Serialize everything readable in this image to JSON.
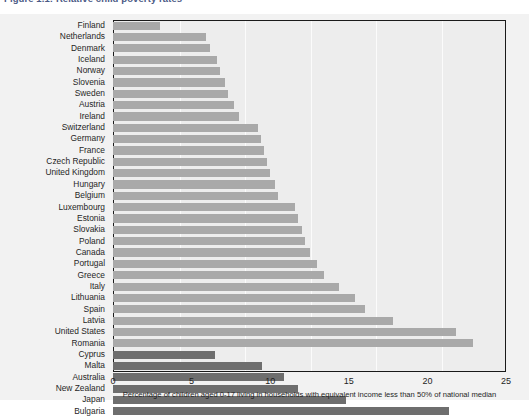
{
  "figure": {
    "title": "Figure 1.1: Relative child poverty rates"
  },
  "axis": {
    "x_label": "Percentage of children aged 0-17 living in households with equivalent income less than 50% of national median",
    "x_ticks": [
      "0",
      "5",
      "10",
      "15",
      "20",
      "25"
    ]
  },
  "colors": {
    "bar_light": "#a9a9a9",
    "bar_dark": "#6e6e6e",
    "plot_background": "#ededed",
    "figure_background": "#f2f2f2",
    "frame": "#1a1a1a",
    "title": "#23356b"
  },
  "chart_data": {
    "type": "bar",
    "orientation": "horizontal",
    "title": "Figure 1.1: Relative child poverty rates",
    "xlabel": "Percentage of children aged 0-17 living in households with equivalent income less than 50% of national median",
    "ylabel": "",
    "xlim": [
      0,
      25
    ],
    "xticks": [
      0,
      5,
      10,
      15,
      20,
      25
    ],
    "grid": true,
    "legend": false,
    "categories": [
      "Finland",
      "Netherlands",
      "Denmark",
      "Iceland",
      "Norway",
      "Slovenia",
      "Sweden",
      "Austria",
      "Ireland",
      "Switzerland",
      "Germany",
      "France",
      "Czech Republic",
      "United Kingdom",
      "Hungary",
      "Belgium",
      "Luxembourg",
      "Estonia",
      "Slovakia",
      "Poland",
      "Canada",
      "Portugal",
      "Greece",
      "Italy",
      "Lithuania",
      "Spain",
      "Latvia",
      "United States",
      "Romania",
      "Cyprus",
      "Malta",
      "Australia",
      "New Zealand",
      "Japan",
      "Bulgaria"
    ],
    "values": [
      3.0,
      5.9,
      6.2,
      6.6,
      6.8,
      7.1,
      7.3,
      7.7,
      8.0,
      9.2,
      9.4,
      9.6,
      9.8,
      10.0,
      10.3,
      10.5,
      11.6,
      11.8,
      12.0,
      12.2,
      12.5,
      13.0,
      13.4,
      14.4,
      15.4,
      16.0,
      17.8,
      21.8,
      22.9,
      6.5,
      9.5,
      10.9,
      11.8,
      14.8,
      21.4
    ],
    "series_groups": [
      {
        "name": "reported-light",
        "color": "#a9a9a9",
        "categories": [
          "Finland",
          "Netherlands",
          "Denmark",
          "Iceland",
          "Norway",
          "Slovenia",
          "Sweden",
          "Austria",
          "Ireland",
          "Switzerland",
          "Germany",
          "France",
          "Czech Republic",
          "United Kingdom",
          "Hungary",
          "Belgium",
          "Luxembourg",
          "Estonia",
          "Slovakia",
          "Poland",
          "Canada",
          "Portugal",
          "Greece",
          "Italy",
          "Lithuania",
          "Spain",
          "Latvia",
          "United States",
          "Romania"
        ]
      },
      {
        "name": "reported-dark",
        "color": "#6e6e6e",
        "categories": [
          "Cyprus",
          "Malta",
          "Australia",
          "New Zealand",
          "Japan",
          "Bulgaria"
        ]
      }
    ]
  }
}
